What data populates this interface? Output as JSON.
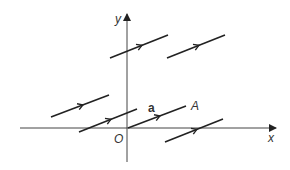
{
  "diagram": {
    "title": "",
    "axes": {
      "x_label": "x",
      "y_label": "y",
      "origin_label": "O"
    },
    "vector_label": "a",
    "point_label": "A",
    "colors": {
      "line": "#222222",
      "axis": "#444444",
      "background": "#ffffff"
    },
    "segments": [
      {
        "id": "seg-1",
        "x1": 110,
        "y1": 58,
        "x2": 168,
        "y2": 35
      },
      {
        "id": "seg-2",
        "x1": 167,
        "y1": 58,
        "x2": 225,
        "y2": 35
      },
      {
        "id": "seg-3",
        "x1": 51,
        "y1": 117,
        "x2": 109,
        "y2": 95
      },
      {
        "id": "seg-4",
        "x1": 79,
        "y1": 132,
        "x2": 137,
        "y2": 109
      },
      {
        "id": "seg-5-a",
        "x1": 128,
        "y1": 128,
        "x2": 186,
        "y2": 106
      },
      {
        "id": "seg-6",
        "x1": 165,
        "y1": 142,
        "x2": 223,
        "y2": 119
      }
    ]
  }
}
